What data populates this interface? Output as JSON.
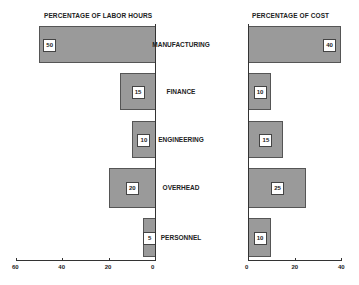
{
  "chart_data": [
    {
      "type": "bar",
      "orientation": "horizontal",
      "direction": "right-to-left",
      "title": "PERCENTAGE OF LABOR HOURS",
      "categories": [
        "MANUFACTURING",
        "FINANCE",
        "ENGINEERING",
        "OVERHEAD",
        "PERSONNEL"
      ],
      "values": [
        50,
        15,
        10,
        20,
        5
      ],
      "xlim": [
        60,
        0
      ],
      "xticks": [
        "60",
        "40",
        "20",
        "0"
      ],
      "grid": false
    },
    {
      "type": "bar",
      "orientation": "horizontal",
      "direction": "left-to-right",
      "title": "PERCENTAGE OF COST",
      "categories": [
        "MANUFACTURING",
        "FINANCE",
        "ENGINEERING",
        "OVERHEAD",
        "PERSONNEL"
      ],
      "values": [
        40,
        10,
        15,
        25,
        10
      ],
      "xlim": [
        0,
        40
      ],
      "xticks": [
        "0",
        "20",
        "40"
      ],
      "grid": false
    }
  ],
  "labels": {
    "left_title": "PERCENTAGE OF LABOR HOURS",
    "right_title": "PERCENTAGE OF COST",
    "categories": [
      "MANUFACTURING",
      "FINANCE",
      "ENGINEERING",
      "OVERHEAD",
      "PERSONNEL"
    ],
    "left_values": [
      "50",
      "15",
      "10",
      "20",
      "5"
    ],
    "right_values": [
      "40",
      "10",
      "15",
      "25",
      "10"
    ],
    "left_ticks": [
      "60",
      "40",
      "20",
      "0"
    ],
    "right_ticks": [
      "0",
      "20",
      "40"
    ]
  }
}
